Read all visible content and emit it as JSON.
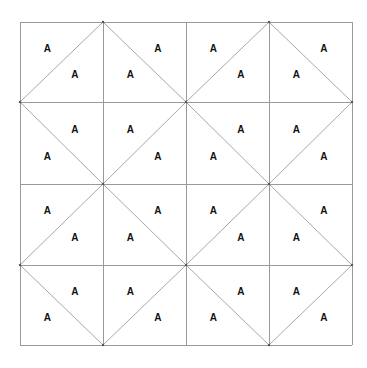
{
  "diagram": {
    "rows": 4,
    "cols": 4,
    "bounds": {
      "left": 20,
      "top": 22,
      "right": 352,
      "bottom": 345
    },
    "col_lines": [
      20,
      103,
      186,
      269,
      352
    ],
    "row_lines": [
      22,
      102,
      184,
      265,
      345
    ],
    "colors": {
      "grid": "#9a9a9a",
      "diagonal": "#a8a8a8",
      "label": "#111111",
      "background": "#ffffff"
    },
    "label_text": "A",
    "cells": [
      {
        "row": 0,
        "col": 0,
        "diagonal": "/",
        "labels": [
          "A",
          "A"
        ]
      },
      {
        "row": 0,
        "col": 1,
        "diagonal": "\\",
        "labels": [
          "A",
          "A"
        ]
      },
      {
        "row": 0,
        "col": 2,
        "diagonal": "/",
        "labels": [
          "A",
          "A"
        ]
      },
      {
        "row": 0,
        "col": 3,
        "diagonal": "\\",
        "labels": [
          "A",
          "A"
        ]
      },
      {
        "row": 1,
        "col": 0,
        "diagonal": "\\",
        "labels": [
          "A",
          "A"
        ]
      },
      {
        "row": 1,
        "col": 1,
        "diagonal": "/",
        "labels": [
          "A",
          "A"
        ]
      },
      {
        "row": 1,
        "col": 2,
        "diagonal": "\\",
        "labels": [
          "A",
          "A"
        ]
      },
      {
        "row": 1,
        "col": 3,
        "diagonal": "/",
        "labels": [
          "A",
          "A"
        ]
      },
      {
        "row": 2,
        "col": 0,
        "diagonal": "/",
        "labels": [
          "A",
          "A"
        ]
      },
      {
        "row": 2,
        "col": 1,
        "diagonal": "\\",
        "labels": [
          "A",
          "A"
        ]
      },
      {
        "row": 2,
        "col": 2,
        "diagonal": "/",
        "labels": [
          "A",
          "A"
        ]
      },
      {
        "row": 2,
        "col": 3,
        "diagonal": "\\",
        "labels": [
          "A",
          "A"
        ]
      },
      {
        "row": 3,
        "col": 0,
        "diagonal": "\\",
        "labels": [
          "A",
          "A"
        ]
      },
      {
        "row": 3,
        "col": 1,
        "diagonal": "/",
        "labels": [
          "A",
          "A"
        ]
      },
      {
        "row": 3,
        "col": 2,
        "diagonal": "\\",
        "labels": [
          "A",
          "A"
        ]
      },
      {
        "row": 3,
        "col": 3,
        "diagonal": "/",
        "labels": [
          "A",
          "A"
        ]
      }
    ]
  }
}
